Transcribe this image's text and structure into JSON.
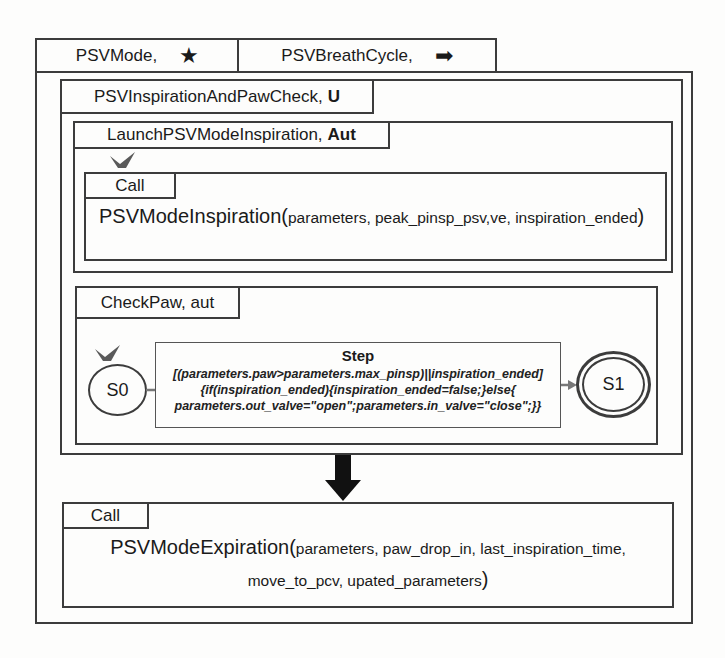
{
  "tabs": [
    {
      "label": "PSVMode,",
      "icon": "★",
      "icon_name": "star-icon"
    },
    {
      "label": "PSVBreathCycle,",
      "icon": "➡",
      "icon_name": "arrow-right-icon"
    }
  ],
  "inspiration_block": {
    "title": "PSVInspirationAndPawCheck,",
    "modifier": "U"
  },
  "launch_block": {
    "title": "LaunchPSVModeInspiration,",
    "modifier": "Aut",
    "call": {
      "label": "Call",
      "function": "PSVModeInspiration(",
      "params": "parameters, peak_pinsp_psv,ve, inspiration_ended",
      "close": ")"
    }
  },
  "checkpaw_block": {
    "title": "CheckPaw, aut",
    "states": [
      {
        "id": "S0",
        "initial": true
      },
      {
        "id": "S1",
        "final": true
      }
    ],
    "step": {
      "title": "Step",
      "lines": [
        "[(parameters.paw>parameters.max_pinsp)||inspiration_ended]",
        "{if(inspiration_ended){inspiration_ended=false;}else{",
        "parameters.out_valve=\"open\";parameters.in_valve=\"close\";}}"
      ]
    }
  },
  "expiration_call": {
    "label": "Call",
    "function": "PSVModeExpiration(",
    "params_line1": "parameters, paw_drop_in, last_inspiration_time,",
    "params_line2": "move_to_pcv, upated_parameters",
    "close": ")"
  },
  "colors": {
    "line": "#3c3c3c",
    "check_mark": "#5a5a5a",
    "arrow": "#111111"
  }
}
